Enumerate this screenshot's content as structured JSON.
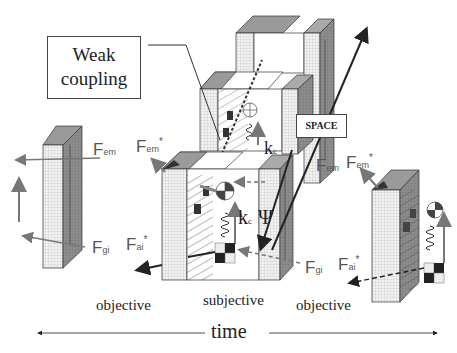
{
  "diagram": {
    "callouts": {
      "weak_coupling_line1": "Weak",
      "weak_coupling_line2": "coupling",
      "space": "SPACE"
    },
    "force_labels": {
      "left_F_em": "F",
      "left_F_em_sub": "em",
      "center_F_em_star": "F",
      "center_F_em_star_sub": "em",
      "center_F_em_star_sup": "*",
      "left_F_gi": "F",
      "left_F_gi_sub": "gi",
      "center_F_ai_star": "F",
      "center_F_ai_star_sub": "ai",
      "center_F_ai_star_sup": "*",
      "right_F_em": "F",
      "right_F_em_sub": "em",
      "right_F_em_star": "F",
      "right_F_em_star_sub": "em",
      "right_F_em_star_sup": "*",
      "right_F_gi": "F",
      "right_F_gi_sub": "gi",
      "right_F_ai_star": "F",
      "right_F_ai_star_sub": "ai",
      "right_F_ai_star_sup": "*"
    },
    "symbols": {
      "kc_main": "k",
      "kc_main_sub": "c",
      "kc_upper": "k",
      "kc_upper_sub": "c",
      "psi": "Ψ"
    },
    "region_labels": {
      "left": "objective",
      "center": "subjective",
      "right": "objective"
    },
    "axis": {
      "label": "time"
    },
    "colors": {
      "panel_grid": "#d9d9d9",
      "panel_dark": "#8a8a8a",
      "panel_top": "#9a9a9a",
      "arrow_gray": "#777777",
      "arrow_dark": "#222222"
    }
  }
}
